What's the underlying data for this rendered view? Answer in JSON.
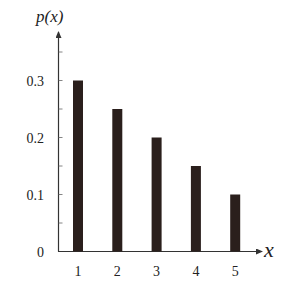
{
  "chart_data": {
    "type": "bar",
    "title": "",
    "xlabel": "x",
    "ylabel": "p(x)",
    "categories": [
      "1",
      "2",
      "3",
      "4",
      "5"
    ],
    "values": [
      0.3,
      0.25,
      0.2,
      0.15,
      0.1
    ],
    "yticks": [
      "0",
      "0.1",
      "0.2",
      "0.3"
    ],
    "ylim": [
      0,
      0.38
    ],
    "grid": false,
    "legend": null,
    "bar_color": "#2a1f1c",
    "axis_color": "#333333"
  }
}
